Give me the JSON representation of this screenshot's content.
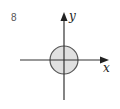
{
  "problem": {
    "number": "8"
  },
  "diagram": {
    "x_label": "x",
    "y_label": "y",
    "circle": {
      "cx": 64,
      "cy": 60,
      "r": 14,
      "fill": "#e0e0e0",
      "stroke": "#555555"
    },
    "axis_color": "#333333"
  }
}
